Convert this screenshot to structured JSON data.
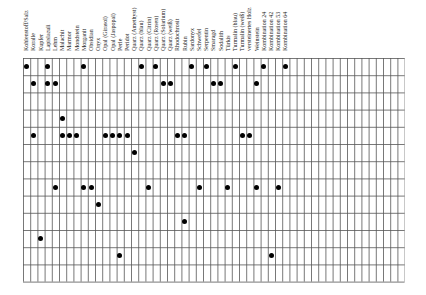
{
  "chart_data": {
    "type": "table",
    "title": "",
    "grid": {
      "columns": 53,
      "rows": 13,
      "origin_x": 22.7,
      "origin_y": 58,
      "col_width": 7.2,
      "row_height": 17.2
    },
    "column_labels": [
      "Kohlenstoff/Salz",
      "Koralle",
      "Kupfer",
      "Lapislazuli",
      "Lehm",
      "Malachit",
      "Marmor",
      "Mondstein",
      "Morganit",
      "Obsidian",
      "Onyx",
      "Opal (Girasol)",
      "Opal (Jaspopal)",
      "Perle",
      "Peridot",
      "Quarz (Amethyst)",
      "Quarz (blau)",
      "Quarz (Citrin)",
      "Quarz (Rosen)",
      "Quarz (Solarium)",
      "Quarz (weiß)",
      "Rhodochrosit",
      "Rubin",
      "Sardonyx",
      "Schwefel",
      "Serpentin",
      "Smaragd",
      "Sodalith",
      "Türkis",
      "Turmalin (blau)",
      "Turmalin (weiß)",
      "versteinertes Holz",
      "Weinstein",
      "Kombination 24",
      "Kombination 42",
      "Kombination 53",
      "Kombination 64"
    ],
    "marks_by_row": [
      {
        "row": 1,
        "columns": [
          1,
          4,
          9,
          17,
          19,
          24,
          26,
          30,
          34,
          37
        ]
      },
      {
        "row": 2,
        "columns": [
          2,
          4,
          5,
          20,
          21,
          27,
          28,
          33
        ]
      },
      {
        "row": 3,
        "columns": []
      },
      {
        "row": 4,
        "columns": [
          6
        ]
      },
      {
        "row": 5,
        "columns": [
          2,
          6,
          7,
          8,
          12,
          13,
          14,
          15,
          22,
          23,
          31,
          32
        ]
      },
      {
        "row": 6,
        "columns": [
          16
        ]
      },
      {
        "row": 7,
        "columns": []
      },
      {
        "row": 8,
        "columns": [
          5,
          9,
          10,
          18,
          25,
          29,
          33,
          36
        ]
      },
      {
        "row": 9,
        "columns": [
          11
        ]
      },
      {
        "row": 10,
        "columns": [
          23
        ]
      },
      {
        "row": 11,
        "columns": [
          3
        ]
      },
      {
        "row": 12,
        "columns": [
          14,
          35
        ]
      },
      {
        "row": 13,
        "columns": []
      }
    ],
    "legend": "none",
    "grid_lines": true
  },
  "colors": {
    "grid": "#555555",
    "dot": "#000000",
    "background": "#ffffff"
  }
}
